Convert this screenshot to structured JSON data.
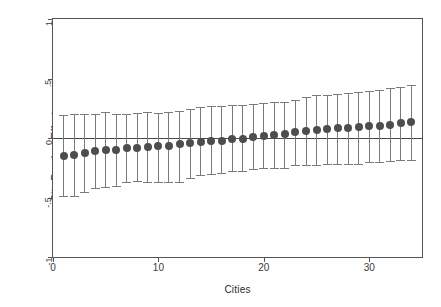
{
  "chart": {
    "title": "",
    "xlabel": "Cities",
    "ylabel": "City Random Effects",
    "ytick_labels": [
      "1",
      ".5",
      "0",
      "-.5",
      "-1"
    ],
    "xtick_labels": [
      "0",
      "10",
      "20",
      "30"
    ],
    "colors": {
      "marker": "#4d4d4d",
      "whisker": "#7a7a7a",
      "zero_line": "#4a4a4a",
      "frame": "#555555",
      "background": "#ffffff"
    }
  },
  "chart_data": {
    "type": "scatter",
    "title": "",
    "xlabel": "Cities",
    "ylabel": "City Random Effects",
    "xlim": [
      0,
      35
    ],
    "ylim": [
      -1,
      1
    ],
    "yticks": [
      1,
      0.5,
      0,
      -0.5,
      -1
    ],
    "ytick_labels": [
      "1",
      ".5",
      "0",
      "-.5",
      "-1"
    ],
    "xticks": [
      0,
      10,
      20,
      30
    ],
    "xtick_labels": [
      "0",
      "10",
      "20",
      "30"
    ],
    "grid": false,
    "legend": "none",
    "annotations": [
      "horizontal reference line at y = 0"
    ],
    "x": [
      1,
      2,
      3,
      4,
      5,
      6,
      7,
      8,
      9,
      10,
      11,
      12,
      13,
      14,
      15,
      16,
      17,
      18,
      19,
      20,
      21,
      22,
      23,
      24,
      25,
      26,
      27,
      28,
      29,
      30,
      31,
      32,
      33,
      34
    ],
    "series": [
      {
        "name": "City Random Effects",
        "values": [
          -0.155,
          -0.14,
          -0.13,
          -0.11,
          -0.105,
          -0.1,
          -0.085,
          -0.08,
          -0.075,
          -0.07,
          -0.065,
          -0.05,
          -0.045,
          -0.03,
          -0.028,
          -0.025,
          -0.01,
          -0.005,
          0.012,
          0.018,
          0.025,
          0.032,
          0.048,
          0.058,
          0.07,
          0.078,
          0.085,
          0.088,
          0.09,
          0.098,
          0.102,
          0.112,
          0.128,
          0.135
        ],
        "ci_lower": [
          -0.49,
          -0.49,
          -0.455,
          -0.42,
          -0.415,
          -0.4,
          -0.37,
          -0.365,
          -0.37,
          -0.37,
          -0.37,
          -0.368,
          -0.338,
          -0.315,
          -0.305,
          -0.298,
          -0.28,
          -0.275,
          -0.258,
          -0.255,
          -0.252,
          -0.252,
          -0.228,
          -0.228,
          -0.225,
          -0.22,
          -0.22,
          -0.222,
          -0.218,
          -0.205,
          -0.2,
          -0.192,
          -0.188,
          -0.188
        ],
        "ci_upper": [
          0.19,
          0.205,
          0.2,
          0.2,
          0.218,
          0.205,
          0.205,
          0.21,
          0.215,
          0.212,
          0.215,
          0.225,
          0.242,
          0.262,
          0.272,
          0.268,
          0.275,
          0.275,
          0.288,
          0.29,
          0.3,
          0.305,
          0.318,
          0.348,
          0.362,
          0.365,
          0.37,
          0.382,
          0.388,
          0.392,
          0.4,
          0.418,
          0.432,
          0.448
        ]
      }
    ]
  }
}
